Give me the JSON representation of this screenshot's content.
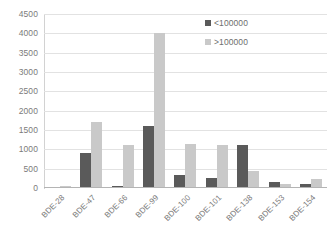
{
  "chart_data": {
    "type": "bar",
    "title": "",
    "subtitle": "",
    "xlabel": "",
    "ylabel": "",
    "categories": [
      "BDE-28",
      "BDE-47",
      "BDE-66",
      "BDE-99",
      "BDE-100",
      "BDE-101",
      "BDE-138",
      "BDE-153",
      "BDE-154"
    ],
    "series": [
      {
        "name": "<100000",
        "color": "#5a5a5a",
        "values": [
          30,
          900,
          50,
          1600,
          330,
          250,
          1100,
          160,
          100
        ]
      },
      {
        "name": ">100000",
        "color": "#c9c9c9",
        "values": [
          40,
          1720,
          1100,
          4000,
          1150,
          1120,
          450,
          100,
          230
        ]
      }
    ],
    "ylim": [
      0,
      4500
    ],
    "ytick_step": 500,
    "ytick_labels": [
      "4500",
      "4000",
      "3500",
      "3000",
      "2500",
      "2000",
      "1500",
      "1000",
      "500",
      "0"
    ],
    "grid": {
      "horizontal": true,
      "vertical": false,
      "color": "#e2e2e2"
    },
    "legend": {
      "position": "top-right",
      "entries": [
        "<100000",
        ">100000"
      ]
    },
    "axis_label_rotation": -45,
    "bar_group_order": [
      "<100000",
      ">100000"
    ]
  }
}
